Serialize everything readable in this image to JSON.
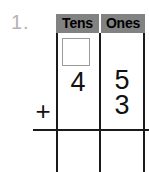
{
  "problem": {
    "number_label": "1.",
    "operator": "+",
    "type": "vertical-addition-with-place-value-chart"
  },
  "table": {
    "headers": [
      "Tens",
      "Ones"
    ],
    "header_background": "#828282",
    "header_text_color": "#000000",
    "grid_color": "#1a1a1a"
  },
  "rows": {
    "carry_row": {
      "tens": "",
      "ones": ""
    },
    "addend_1": {
      "tens": "4",
      "ones": "5"
    },
    "addend_2": {
      "tens": "",
      "ones": "3"
    },
    "answer": {
      "tens": "",
      "ones": ""
    }
  },
  "carry_box": {
    "value": "",
    "border_color": "#9a9a9a"
  },
  "colors": {
    "background": "#ffffff",
    "digit": "#111111",
    "problem_number": "#b3b3b3"
  }
}
